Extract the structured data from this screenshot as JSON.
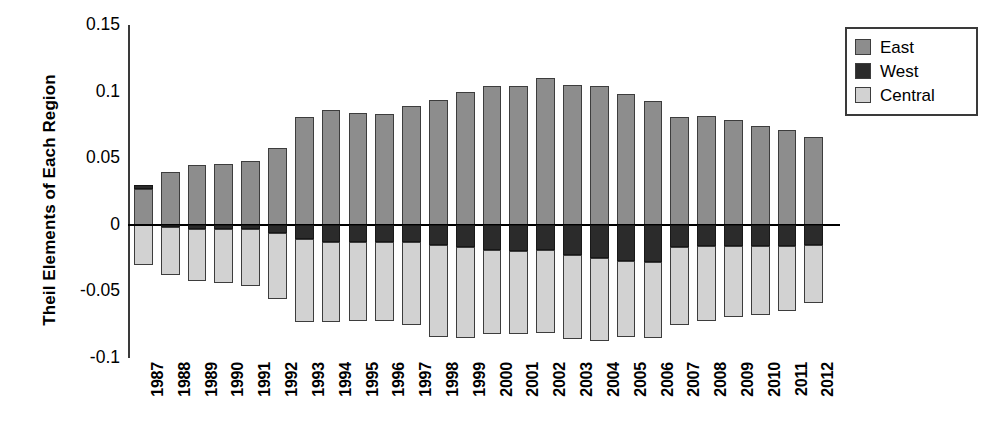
{
  "chart_data": {
    "type": "bar",
    "title": "",
    "subtitle": "",
    "xlabel": "",
    "ylabel": "Theil Elements of Each Region",
    "stacked": true,
    "orientation": "vertical",
    "grid": false,
    "legend_position": "top-right",
    "ylim": [
      -0.1,
      0.15
    ],
    "yticks": [
      0.15,
      0.1,
      0.05,
      0,
      -0.05,
      -0.1
    ],
    "ytick_labels": [
      "0.15",
      "0.1",
      "0.05",
      "0",
      "-0.05",
      "-0.1"
    ],
    "categories": [
      "1987",
      "1988",
      "1989",
      "1990",
      "1991",
      "1992",
      "1993",
      "1994",
      "1995",
      "1996",
      "1997",
      "1998",
      "1999",
      "2000",
      "2001",
      "2002",
      "2003",
      "2004",
      "2005",
      "2006",
      "2007",
      "2008",
      "2009",
      "2010",
      "2011",
      "2012"
    ],
    "series": [
      {
        "name": "East",
        "color": "#8d8d8d",
        "values": [
          0.027,
          0.04,
          0.045,
          0.046,
          0.048,
          0.058,
          0.081,
          0.086,
          0.084,
          0.083,
          0.089,
          0.094,
          0.1,
          0.104,
          0.104,
          0.11,
          0.105,
          0.104,
          0.098,
          0.093,
          0.081,
          0.082,
          0.079,
          0.074,
          0.071,
          0.066
        ]
      },
      {
        "name": "West",
        "color": "#2b2b2b",
        "values": [
          0.003,
          -0.002,
          -0.003,
          -0.003,
          -0.003,
          -0.006,
          -0.011,
          -0.013,
          -0.013,
          -0.013,
          -0.013,
          -0.015,
          -0.017,
          -0.019,
          -0.02,
          -0.019,
          -0.023,
          -0.025,
          -0.027,
          -0.028,
          -0.017,
          -0.016,
          -0.016,
          -0.016,
          -0.016,
          -0.015
        ]
      },
      {
        "name": "Central",
        "color": "#d2d2d2",
        "values": [
          -0.03,
          -0.036,
          -0.039,
          -0.041,
          -0.043,
          -0.05,
          -0.062,
          -0.06,
          -0.059,
          -0.059,
          -0.062,
          -0.069,
          -0.068,
          -0.063,
          -0.062,
          -0.062,
          -0.063,
          -0.062,
          -0.057,
          -0.057,
          -0.058,
          -0.056,
          -0.053,
          -0.052,
          -0.049,
          -0.044
        ]
      }
    ]
  },
  "legend": {
    "items": [
      {
        "label": "East",
        "color": "#8d8d8d"
      },
      {
        "label": "West",
        "color": "#2b2b2b"
      },
      {
        "label": "Central",
        "color": "#d2d2d2"
      }
    ]
  }
}
